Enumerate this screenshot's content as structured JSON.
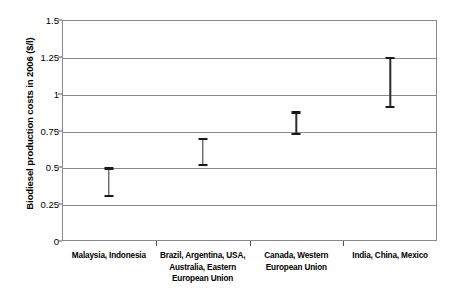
{
  "chart_data": {
    "type": "bar",
    "chart_style": "floating-range-bars",
    "title": "",
    "subtitle": "",
    "xlabel": "",
    "ylabel": "Biodiesel production costs in 2006 ($/l)",
    "ylim": [
      0,
      1.5
    ],
    "xlim_note": "4 equal categorical bands",
    "grid": true,
    "grid_axis": "y",
    "legend": false,
    "legend_position": "none",
    "y_ticks": [
      "0",
      "0.25",
      "0.5",
      "0.75",
      "1",
      "1.25",
      "1.5"
    ],
    "y_tick_values": [
      0,
      0.25,
      0.5,
      0.75,
      1,
      1.25,
      1.5
    ],
    "categories": [
      "Malaysia, Indonesia",
      "Brazil, Argentina, USA, Australia, Eastern European Union",
      "Canada, Western European Union",
      "India, China, Mexico"
    ],
    "series": [
      {
        "name": "low",
        "values": [
          0.3,
          0.51,
          0.72,
          0.9
        ]
      },
      {
        "name": "high",
        "values": [
          0.5,
          0.7,
          0.88,
          1.25
        ]
      }
    ],
    "points": [
      {
        "category": "Malaysia, Indonesia",
        "low": 0.3,
        "high": 0.5
      },
      {
        "category": "Brazil, Argentina, USA, Australia, Eastern European Union",
        "low": 0.51,
        "high": 0.7
      },
      {
        "category": "Canada, Western European Union",
        "low": 0.72,
        "high": 0.88
      },
      {
        "category": "India, China, Mexico",
        "low": 0.9,
        "high": 1.25
      }
    ],
    "colors": {
      "background": "#ffffff",
      "gridline": "#8a8a8a",
      "frame": "#8a8a8a",
      "marker": "#1a1a1a",
      "text": "#000000"
    }
  },
  "axis": {
    "y_title": "Biodiesel production costs in 2006 ($/l)",
    "ticks": [
      {
        "label": "1.5",
        "value": 1.5
      },
      {
        "label": "1.25",
        "value": 1.25
      },
      {
        "label": "1",
        "value": 1
      },
      {
        "label": "0.75",
        "value": 0.75
      },
      {
        "label": "0.5",
        "value": 0.5
      },
      {
        "label": "0.25",
        "value": 0.25
      },
      {
        "label": "0",
        "value": 0
      }
    ]
  },
  "categories": [
    {
      "label": "Malaysia, Indonesia"
    },
    {
      "label": "Brazil, Argentina, USA, Australia, Eastern European Union"
    },
    {
      "label": "Canada, Western European Union"
    },
    {
      "label": "India, China, Mexico"
    }
  ]
}
